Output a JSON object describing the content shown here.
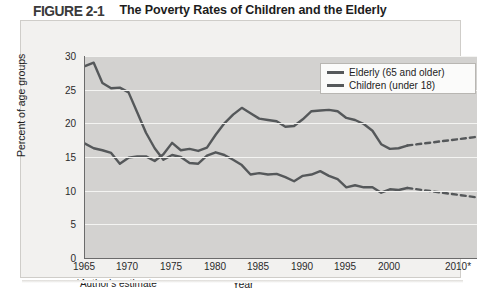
{
  "figure": {
    "number": "FIGURE 2-1",
    "title": "The Poverty Rates of Children and the Elderly"
  },
  "legend": {
    "items": [
      {
        "label": "Elderly (65 and older)",
        "color": "#55585a"
      },
      {
        "label": "Children (under 18)",
        "color": "#55585a"
      }
    ]
  },
  "axes": {
    "y_title": "Percent of age groups",
    "x_title": "Year",
    "footnote": "*Author's estimate",
    "y_ticks": [
      "0",
      "5",
      "10",
      "15",
      "20",
      "25",
      "30"
    ],
    "x_ticks": [
      "1965",
      "1970",
      "1975",
      "1980",
      "1985",
      "1990",
      "1995",
      "2000",
      "2010*"
    ]
  },
  "chart_data": {
    "type": "line",
    "title": "The Poverty Rates of Children and the Elderly",
    "xlabel": "Year",
    "ylabel": "Percent of age groups",
    "xlim": [
      1965,
      2010
    ],
    "ylim": [
      0,
      30
    ],
    "grid": true,
    "legend_position": "top-right",
    "annotations": [
      "*Author's estimate"
    ],
    "series": [
      {
        "name": "Elderly (65 and older)",
        "color": "#55585a",
        "x": [
          1965,
          1966,
          1967,
          1968,
          1969,
          1970,
          1971,
          1972,
          1973,
          1974,
          1975,
          1976,
          1977,
          1978,
          1979,
          1980,
          1981,
          1982,
          1983,
          1984,
          1985,
          1986,
          1987,
          1988,
          1989,
          1990,
          1991,
          1992,
          1993,
          1994,
          1995,
          1996,
          1997,
          1998,
          1999,
          2000,
          2001,
          2002
        ],
        "values": [
          28.5,
          29.0,
          26.0,
          25.2,
          25.3,
          24.6,
          21.6,
          18.6,
          16.3,
          14.6,
          15.3,
          15.0,
          14.1,
          14.0,
          15.2,
          15.7,
          15.3,
          14.6,
          13.8,
          12.4,
          12.6,
          12.4,
          12.5,
          12.0,
          11.4,
          12.2,
          12.4,
          12.9,
          12.2,
          11.7,
          10.5,
          10.8,
          10.5,
          10.5,
          9.7,
          10.2,
          10.1,
          10.4
        ],
        "dashed_from": 2002,
        "dashed_x": [
          2002,
          2010
        ],
        "dashed_values": [
          10.4,
          9.0
        ]
      },
      {
        "name": "Children (under 18)",
        "color": "#55585a",
        "x": [
          1965,
          1966,
          1967,
          1968,
          1969,
          1970,
          1971,
          1972,
          1973,
          1974,
          1975,
          1976,
          1977,
          1978,
          1979,
          1980,
          1981,
          1982,
          1983,
          1984,
          1985,
          1986,
          1987,
          1988,
          1989,
          1990,
          1991,
          1992,
          1993,
          1994,
          1995,
          1996,
          1997,
          1998,
          1999,
          2000,
          2001,
          2002
        ],
        "values": [
          17.0,
          16.3,
          16.0,
          15.6,
          14.0,
          14.9,
          15.1,
          15.1,
          14.4,
          15.4,
          17.1,
          16.0,
          16.2,
          15.9,
          16.4,
          18.3,
          20.0,
          21.3,
          22.3,
          21.5,
          20.7,
          20.5,
          20.3,
          19.5,
          19.6,
          20.6,
          21.8,
          21.9,
          22.0,
          21.8,
          20.8,
          20.5,
          19.9,
          18.9,
          16.9,
          16.2,
          16.3,
          16.7
        ],
        "dashed_from": 2002,
        "dashed_x": [
          2002,
          2010
        ],
        "dashed_values": [
          16.7,
          18.0
        ]
      }
    ]
  }
}
